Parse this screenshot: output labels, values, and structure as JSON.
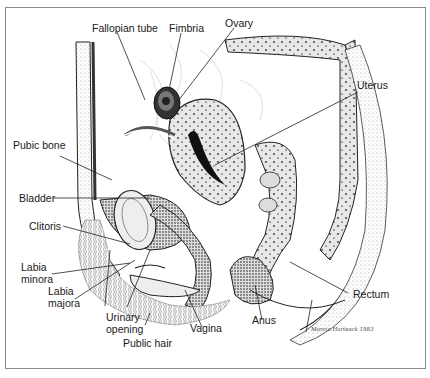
{
  "figure": {
    "labels": {
      "fallopian_tube": "Fallopian tube",
      "fimbria": "Fimbria",
      "ovary": "Ovary",
      "uterus": "Uterus",
      "pubic_bone": "Pubic bone",
      "bladder": "Bladder",
      "clitoris": "Clitoris",
      "labia_minora_1": "Labia",
      "labia_minora_2": "minora",
      "labia_majora_1": "Labia",
      "labia_majora_2": "majora",
      "urinary_opening_1": "Urinary",
      "urinary_opening_2": "opening",
      "public_hair": "Public hair",
      "vagina": "Vagina",
      "anus": "Anus",
      "rectum": "Rectum"
    },
    "signature": "Marcia Hartsock 1983"
  }
}
